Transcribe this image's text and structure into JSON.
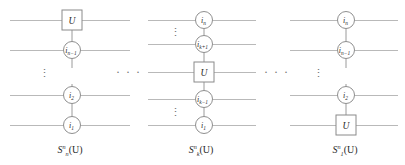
{
  "figure": {
    "kind": "quantum-circuit-diagram",
    "background": "#ffffff",
    "wire_color": "#b9b9b9",
    "ink_color": "#2a2a2a",
    "separator_dots": "· · ·",
    "vertical_dots": "⋮"
  },
  "circuits": [
    {
      "id": "left",
      "caption": {
        "base": "S",
        "sub": "n",
        "sup": "n",
        "arg": "(U)"
      },
      "caption_text": "S_n^n(U)",
      "elements": [
        {
          "type": "gate",
          "label": "U",
          "wire": 1
        },
        {
          "type": "control",
          "label": "i",
          "sub": "n−1",
          "wire": 2
        },
        {
          "type": "vdots",
          "wire": 3
        },
        {
          "type": "control",
          "label": "i",
          "sub": "2",
          "wire": 4
        },
        {
          "type": "control",
          "label": "i",
          "sub": "1",
          "wire": 5
        }
      ]
    },
    {
      "id": "middle",
      "caption": {
        "base": "S",
        "sub": "k",
        "sup": "n",
        "arg": "(U)"
      },
      "caption_text": "S_k^n(U)",
      "elements": [
        {
          "type": "control",
          "label": "i",
          "sub": "n",
          "wire": 1
        },
        {
          "type": "vdots",
          "wire": 2
        },
        {
          "type": "control",
          "label": "i",
          "sub": "k+1",
          "wire": 3
        },
        {
          "type": "gate",
          "label": "U",
          "wire": 4
        },
        {
          "type": "control",
          "label": "i",
          "sub": "k−1",
          "wire": 5
        },
        {
          "type": "vdots",
          "wire": 6
        },
        {
          "type": "control",
          "label": "i",
          "sub": "1",
          "wire": 7
        }
      ]
    },
    {
      "id": "right",
      "caption": {
        "base": "S",
        "sub": "1",
        "sup": "n",
        "arg": "(U)"
      },
      "caption_text": "S_1^n(U)",
      "elements": [
        {
          "type": "control",
          "label": "i",
          "sub": "n",
          "wire": 1
        },
        {
          "type": "control",
          "label": "i",
          "sub": "n−1",
          "wire": 2
        },
        {
          "type": "vdots",
          "wire": 3
        },
        {
          "type": "control",
          "label": "i",
          "sub": "2",
          "wire": 4
        },
        {
          "type": "gate",
          "label": "U",
          "wire": 5
        }
      ]
    }
  ]
}
